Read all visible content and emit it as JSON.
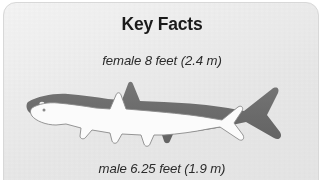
{
  "card": {
    "title": "Key Facts",
    "background_color": "#f4f4f4",
    "border_color": "#d8d8d8",
    "title_color": "#1b1b1b"
  },
  "measurements": {
    "female": {
      "label": "female 8 feet (2.4 m)",
      "sex": "female",
      "length_feet": "8",
      "length_meters": "2.4"
    },
    "male": {
      "label": "male 6.25 feet (1.9 m)",
      "sex": "male",
      "length_feet": "6.25",
      "length_meters": "1.9"
    }
  },
  "illustration": {
    "name": "shark-size-comparison",
    "description": "Two overlaid shark silhouettes comparing female and male body length",
    "female_shark_fill": "#6b6b6b",
    "male_shark_fill": "#fafafa",
    "male_shark_outline": "#888888"
  }
}
